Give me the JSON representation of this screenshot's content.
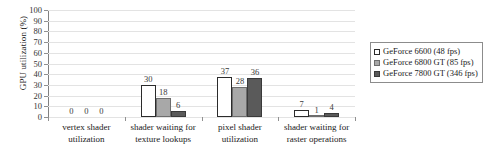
{
  "chart_data": {
    "type": "bar",
    "title": "",
    "xlabel": "",
    "ylabel": "GPU utilization (%)",
    "ylim": [
      0,
      100
    ],
    "ytick_step": 10,
    "yticks": [
      100,
      90,
      80,
      70,
      60,
      50,
      40,
      30,
      20,
      10,
      0
    ],
    "grid": true,
    "legend_position": "right",
    "categories": [
      [
        "vertex shader",
        "utilization"
      ],
      [
        "shader waiting for",
        "texture lookups"
      ],
      [
        "pixel shader",
        "utilization"
      ],
      [
        "shader waiting for",
        "raster operations"
      ]
    ],
    "series": [
      {
        "name": "GeForce 6600 (48 fps)",
        "color": "#ffffff",
        "values": [
          0,
          30,
          37,
          7
        ]
      },
      {
        "name": "GeForce 6800 GT (85 fps)",
        "color": "#a8a8a8",
        "values": [
          0,
          18,
          28,
          1
        ]
      },
      {
        "name": "GeForce 7800 GT (346 fps)",
        "color": "#5a5a5a",
        "values": [
          0,
          6,
          36,
          4
        ]
      }
    ]
  },
  "legend": {
    "items": [
      {
        "label": "GeForce 6600 (48 fps)"
      },
      {
        "label": "GeForce 6800 GT (85 fps)"
      },
      {
        "label": "GeForce 7800 GT (346 fps)"
      }
    ]
  }
}
